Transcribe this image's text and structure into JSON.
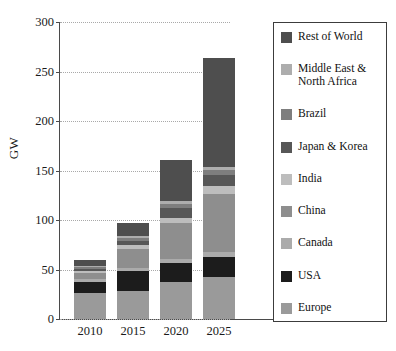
{
  "chart_data": {
    "type": "bar",
    "stacked": true,
    "title": "",
    "xlabel": "",
    "ylabel": "GW",
    "categories": [
      "2010",
      "2015",
      "2020",
      "2025"
    ],
    "ylim": [
      0,
      300
    ],
    "yticks": [
      0,
      50,
      100,
      150,
      200,
      250,
      300
    ],
    "ytick_labels": [
      "0",
      "50",
      "100",
      "150",
      "200",
      "250",
      "300"
    ],
    "grid": true,
    "grid_axis": "y",
    "grid_style": "dotted",
    "legend_position": "right",
    "stack_order_bottom_to_top": [
      "Europe",
      "USA",
      "Canada",
      "China",
      "India",
      "Japan & Korea",
      "Brazil",
      "Middle East & North Africa",
      "Rest of World"
    ],
    "series": [
      {
        "name": "Europe",
        "color": "#9a9a9a",
        "values": [
          26,
          28,
          37,
          42
        ]
      },
      {
        "name": "USA",
        "color": "#1c1c1c",
        "values": [
          11,
          20,
          20,
          21
        ]
      },
      {
        "name": "Canada",
        "color": "#ababab",
        "values": [
          3,
          3,
          4,
          5
        ]
      },
      {
        "name": "China",
        "color": "#8e8e8e",
        "values": [
          6,
          20,
          36,
          58
        ]
      },
      {
        "name": "India",
        "color": "#bdbdbd",
        "values": [
          2,
          4,
          5,
          8
        ]
      },
      {
        "name": "Japan & Korea",
        "color": "#575757",
        "values": [
          3,
          4,
          10,
          11
        ]
      },
      {
        "name": "Brazil",
        "color": "#7e7e7e",
        "values": [
          2,
          3,
          4,
          5
        ]
      },
      {
        "name": "Middle East & North Africa",
        "color": "#adadad",
        "values": [
          1,
          2,
          3,
          4
        ]
      },
      {
        "name": "Rest of World",
        "color": "#4e4e4e",
        "values": [
          6,
          13,
          42,
          110
        ]
      }
    ],
    "totals": [
      60,
      97,
      161,
      264
    ]
  },
  "legend": {
    "items": [
      {
        "label": "Rest of World",
        "color": "#4e4e4e"
      },
      {
        "label": "Middle East &\nNorth Africa",
        "color": "#adadad"
      },
      {
        "label": "Brazil",
        "color": "#7e7e7e"
      },
      {
        "label": "Japan & Korea",
        "color": "#575757"
      },
      {
        "label": "India",
        "color": "#bdbdbd"
      },
      {
        "label": "China",
        "color": "#8e8e8e"
      },
      {
        "label": "Canada",
        "color": "#ababab"
      },
      {
        "label": "USA",
        "color": "#1c1c1c"
      },
      {
        "label": "Europe",
        "color": "#9a9a9a"
      }
    ]
  }
}
